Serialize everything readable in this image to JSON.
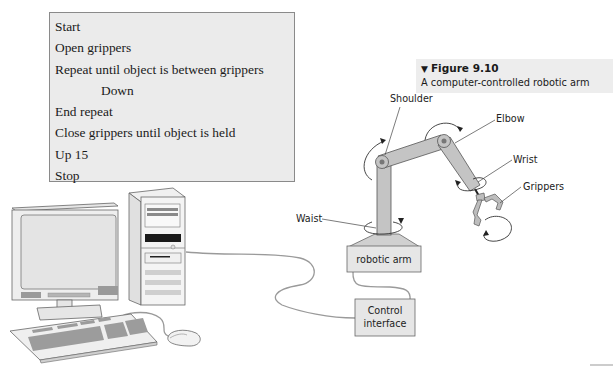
{
  "algorithm": {
    "lines": [
      {
        "text": "Start",
        "indent": false
      },
      {
        "text": "Open grippers",
        "indent": false
      },
      {
        "text": "Repeat until object is between grippers",
        "indent": false
      },
      {
        "text": "Down",
        "indent": true
      },
      {
        "text": "End repeat",
        "indent": false
      },
      {
        "text": "Close grippers until object is held",
        "indent": false
      },
      {
        "text": "Up 15",
        "indent": false
      },
      {
        "text": "Stop",
        "indent": false
      }
    ]
  },
  "figure": {
    "marker": "▼",
    "number": "Figure 9.10",
    "caption": "A computer-controlled robotic arm"
  },
  "labels": {
    "shoulder": "Shoulder",
    "elbow": "Elbow",
    "wrist": "Wrist",
    "grippers": "Grippers",
    "waist": "Waist"
  },
  "boxes": {
    "robotic_arm": "robotic arm",
    "control_interface_line1": "Control",
    "control_interface_line2": "interface"
  },
  "colors": {
    "panel_bg": "#ebebeb",
    "arm_fill": "#c8c8c8",
    "outline": "#555555",
    "cable": "#9a9a9a"
  }
}
